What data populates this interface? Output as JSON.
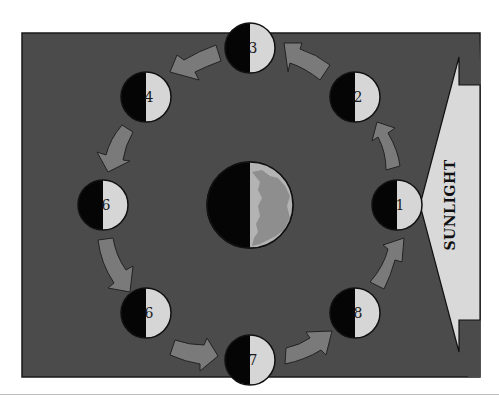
{
  "diagram": {
    "sunlight_label": "SUNLIGHT",
    "colors": {
      "panel": "#4b4b4b",
      "panel_border": "#1a1a1a",
      "moon_dark": "#050505",
      "moon_lit": "#d6d6d6",
      "arrow_fill": "#7a7a7a",
      "sunlight_fill": "#d9d9d9",
      "earth_land": "#8e8e8e",
      "earth_lit": "#b3b3b3"
    },
    "earth": {
      "cx": 250,
      "cy": 205,
      "r": 43
    },
    "moons": [
      {
        "label": "1",
        "cx": 397,
        "cy": 205
      },
      {
        "label": "2",
        "cx": 355,
        "cy": 97
      },
      {
        "label": "3",
        "cx": 250,
        "cy": 48
      },
      {
        "label": "4",
        "cx": 146,
        "cy": 97
      },
      {
        "label": "6",
        "cx": 103,
        "cy": 205
      },
      {
        "label": "6",
        "cx": 146,
        "cy": 313
      },
      {
        "label": "7",
        "cx": 250,
        "cy": 360
      },
      {
        "label": "8",
        "cx": 355,
        "cy": 313
      }
    ]
  }
}
